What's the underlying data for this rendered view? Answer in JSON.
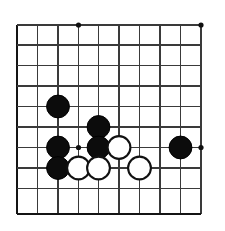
{
  "figure": {
    "background_color": "#ffffff",
    "line_color": "#3a3a3a",
    "edge_color": "#141414",
    "black_stone_color": "#0c0c0c",
    "white_stone_color": "#ffffff"
  },
  "board": {
    "type": "go-board-crop",
    "visible_columns": 10,
    "visible_rows": 10,
    "column_labels": [
      "A",
      "B",
      "C",
      "D",
      "E",
      "F",
      "G",
      "H",
      "J",
      "K"
    ],
    "row_labels": [
      "10",
      "9",
      "8",
      "7",
      "6",
      "5",
      "4",
      "3",
      "2",
      "1"
    ],
    "grid": {
      "x_positions": [
        17,
        37.5,
        58,
        78.5,
        98.5,
        119,
        139.5,
        160,
        180.5,
        201
      ],
      "y_positions": [
        25,
        45,
        65.5,
        86,
        106.5,
        127,
        147.5,
        168,
        188.5,
        214
      ],
      "line_width": 1.6,
      "edge_line_width": 2.6,
      "bottom_edge_is_board_border": true,
      "left_edge_is_board_border": true
    },
    "star_points": [
      {
        "col": 3,
        "row": 0,
        "x": 78.5,
        "y": 25
      },
      {
        "col": 3,
        "row": 6,
        "x": 78.5,
        "y": 147.5
      },
      {
        "col": 9,
        "row": 0,
        "x": 201,
        "y": 25
      },
      {
        "col": 9,
        "row": 6,
        "x": 201,
        "y": 147.5
      }
    ],
    "stone_radius": 11.4,
    "stones": [
      {
        "id": "b1",
        "color": "black",
        "col": 2,
        "row": 4,
        "x": 58,
        "y": 106.5
      },
      {
        "id": "b2",
        "color": "black",
        "col": 4,
        "row": 5,
        "x": 98.5,
        "y": 127
      },
      {
        "id": "b3",
        "color": "black",
        "col": 2,
        "row": 6,
        "x": 58,
        "y": 147.5
      },
      {
        "id": "b4",
        "color": "black",
        "col": 4,
        "row": 6,
        "x": 98.5,
        "y": 147.5
      },
      {
        "id": "w1",
        "color": "white",
        "col": 5,
        "row": 6,
        "x": 119,
        "y": 147.5
      },
      {
        "id": "b5",
        "color": "black",
        "col": 8,
        "row": 6,
        "x": 180.5,
        "y": 147.5
      },
      {
        "id": "b6",
        "color": "black",
        "col": 2,
        "row": 7,
        "x": 58,
        "y": 168
      },
      {
        "id": "w2",
        "color": "white",
        "col": 3,
        "row": 7,
        "x": 78.5,
        "y": 168
      },
      {
        "id": "w3",
        "color": "white",
        "col": 4,
        "row": 7,
        "x": 98.5,
        "y": 168
      },
      {
        "id": "w4",
        "color": "white",
        "col": 6,
        "row": 7,
        "x": 139.5,
        "y": 168
      }
    ],
    "stone_counts": {
      "black": 6,
      "white": 4,
      "total": 10
    }
  }
}
